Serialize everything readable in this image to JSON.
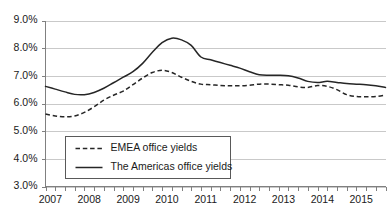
{
  "chart_data": {
    "type": "line",
    "title": "",
    "subtitle": "",
    "xlabel": "",
    "ylabel": "",
    "ylim": [
      3.0,
      9.0
    ],
    "ytick_step": 1.0,
    "ytick_labels": [
      "9.0%",
      "8.0%",
      "7.0%",
      "6.0%",
      "5.0%",
      "4.0%",
      "3.0%"
    ],
    "ytick_values": [
      9.0,
      8.0,
      7.0,
      6.0,
      5.0,
      4.0,
      3.0
    ],
    "xtick_labels": [
      "2007",
      "2008",
      "2009",
      "2010",
      "2011",
      "2012",
      "2013",
      "2014",
      "2015"
    ],
    "xtick_values": [
      2007,
      2008,
      2009,
      2010,
      2011,
      2012,
      2013,
      2014,
      2015
    ],
    "xlim": [
      2007.0,
      2015.75
    ],
    "x_minor_ticks_per_year": 4,
    "grid": "horizontal",
    "legend_position": "inside-lower-left",
    "units": "percent",
    "x": [
      2007.0,
      2007.25,
      2007.5,
      2007.75,
      2008.0,
      2008.25,
      2008.5,
      2008.75,
      2009.0,
      2009.25,
      2009.5,
      2009.75,
      2010.0,
      2010.25,
      2010.5,
      2010.75,
      2011.0,
      2011.25,
      2011.5,
      2011.75,
      2012.0,
      2012.25,
      2012.5,
      2012.75,
      2013.0,
      2013.25,
      2013.5,
      2013.75,
      2014.0,
      2014.25,
      2014.5,
      2014.75,
      2015.0,
      2015.25,
      2015.5,
      2015.75
    ],
    "series": [
      {
        "name": "EMEA office yields",
        "style": "dashed",
        "color": "#262626",
        "values": [
          5.62,
          5.55,
          5.52,
          5.55,
          5.68,
          5.88,
          6.12,
          6.3,
          6.45,
          6.68,
          6.92,
          7.12,
          7.2,
          7.12,
          6.95,
          6.8,
          6.7,
          6.68,
          6.65,
          6.64,
          6.64,
          6.66,
          6.7,
          6.7,
          6.68,
          6.66,
          6.6,
          6.58,
          6.65,
          6.62,
          6.5,
          6.32,
          6.25,
          6.24,
          6.25,
          6.3
        ]
      },
      {
        "name": "The Americas office yields",
        "style": "solid",
        "color": "#262626",
        "values": [
          6.62,
          6.52,
          6.42,
          6.33,
          6.32,
          6.4,
          6.55,
          6.75,
          6.95,
          7.15,
          7.45,
          7.85,
          8.2,
          8.36,
          8.3,
          8.1,
          7.68,
          7.58,
          7.48,
          7.38,
          7.28,
          7.15,
          7.04,
          7.02,
          7.02,
          7.0,
          6.92,
          6.8,
          6.76,
          6.8,
          6.76,
          6.72,
          6.7,
          6.68,
          6.64,
          6.58
        ]
      }
    ]
  },
  "legend": {
    "items": [
      {
        "label": "EMEA office yields",
        "style": "dashed"
      },
      {
        "label": "The Americas office yields",
        "style": "solid"
      }
    ]
  }
}
